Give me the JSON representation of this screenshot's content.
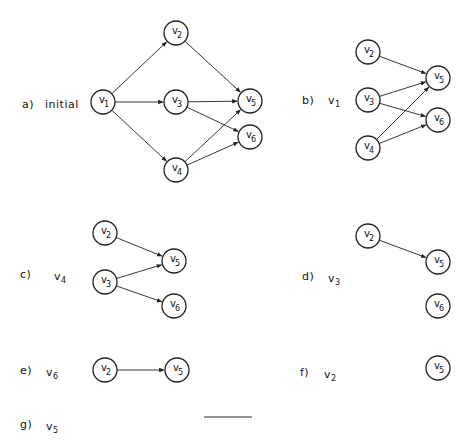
{
  "figure": {
    "node_radius": 12,
    "stroke": "#222222",
    "panels": [
      {
        "id": "a",
        "label": "a)",
        "caption": "initial",
        "caption_sub": "",
        "label_pos": [
          22,
          98
        ],
        "caption_pos": [
          45,
          98
        ],
        "nodes": [
          {
            "name": "v",
            "sub": "1",
            "x": 103,
            "y": 102
          },
          {
            "name": "v",
            "sub": "2",
            "x": 176,
            "y": 33
          },
          {
            "name": "v",
            "sub": "3",
            "x": 176,
            "y": 102
          },
          {
            "name": "v",
            "sub": "4",
            "x": 176,
            "y": 170
          },
          {
            "name": "v",
            "sub": "5",
            "x": 250,
            "y": 101
          },
          {
            "name": "v",
            "sub": "6",
            "x": 250,
            "y": 137
          }
        ],
        "edges": [
          [
            0,
            1
          ],
          [
            0,
            2
          ],
          [
            0,
            3
          ],
          [
            1,
            4
          ],
          [
            2,
            4
          ],
          [
            2,
            5
          ],
          [
            3,
            4
          ],
          [
            3,
            5
          ]
        ]
      },
      {
        "id": "b",
        "label": "b)",
        "caption": "v",
        "caption_sub": "1",
        "label_pos": [
          302,
          94
        ],
        "caption_pos": [
          328,
          94
        ],
        "nodes": [
          {
            "name": "v",
            "sub": "2",
            "x": 368,
            "y": 52
          },
          {
            "name": "v",
            "sub": "3",
            "x": 368,
            "y": 100
          },
          {
            "name": "v",
            "sub": "4",
            "x": 368,
            "y": 148
          },
          {
            "name": "v",
            "sub": "5",
            "x": 438,
            "y": 78
          },
          {
            "name": "v",
            "sub": "6",
            "x": 438,
            "y": 120
          }
        ],
        "edges": [
          [
            0,
            3
          ],
          [
            1,
            3
          ],
          [
            1,
            4
          ],
          [
            2,
            3
          ],
          [
            2,
            4
          ]
        ]
      },
      {
        "id": "c",
        "label": "c)",
        "caption": "v",
        "caption_sub": "4",
        "label_pos": [
          20,
          268
        ],
        "caption_pos": [
          54,
          270
        ],
        "nodes": [
          {
            "name": "v",
            "sub": "2",
            "x": 105,
            "y": 233
          },
          {
            "name": "v",
            "sub": "3",
            "x": 105,
            "y": 282
          },
          {
            "name": "v",
            "sub": "5",
            "x": 174,
            "y": 261
          },
          {
            "name": "v",
            "sub": "6",
            "x": 174,
            "y": 306
          }
        ],
        "edges": [
          [
            0,
            2
          ],
          [
            1,
            2
          ],
          [
            1,
            3
          ]
        ]
      },
      {
        "id": "d",
        "label": "d)",
        "caption": "v",
        "caption_sub": "3",
        "label_pos": [
          302,
          270
        ],
        "caption_pos": [
          328,
          272
        ],
        "nodes": [
          {
            "name": "v",
            "sub": "2",
            "x": 368,
            "y": 236
          },
          {
            "name": "v",
            "sub": "5",
            "x": 438,
            "y": 262
          },
          {
            "name": "v",
            "sub": "6",
            "x": 438,
            "y": 306
          }
        ],
        "edges": [
          [
            0,
            1
          ]
        ]
      },
      {
        "id": "e",
        "label": "e)",
        "caption": "v",
        "caption_sub": "6",
        "label_pos": [
          20,
          364
        ],
        "caption_pos": [
          46,
          366
        ],
        "nodes": [
          {
            "name": "v",
            "sub": "2",
            "x": 105,
            "y": 370
          },
          {
            "name": "v",
            "sub": "5",
            "x": 177,
            "y": 370
          }
        ],
        "edges": [
          [
            0,
            1
          ]
        ]
      },
      {
        "id": "f",
        "label": "f)",
        "caption": "v",
        "caption_sub": "2",
        "label_pos": [
          300,
          366
        ],
        "caption_pos": [
          324,
          368
        ],
        "nodes": [
          {
            "name": "v",
            "sub": "5",
            "x": 438,
            "y": 368
          }
        ],
        "edges": []
      },
      {
        "id": "g",
        "label": "g)",
        "caption": "v",
        "caption_sub": "5",
        "label_pos": [
          20,
          418
        ],
        "caption_pos": [
          46,
          420
        ],
        "nodes": [],
        "edges": [],
        "empty_line": {
          "x1": 204,
          "x2": 252,
          "y": 417
        }
      }
    ]
  }
}
